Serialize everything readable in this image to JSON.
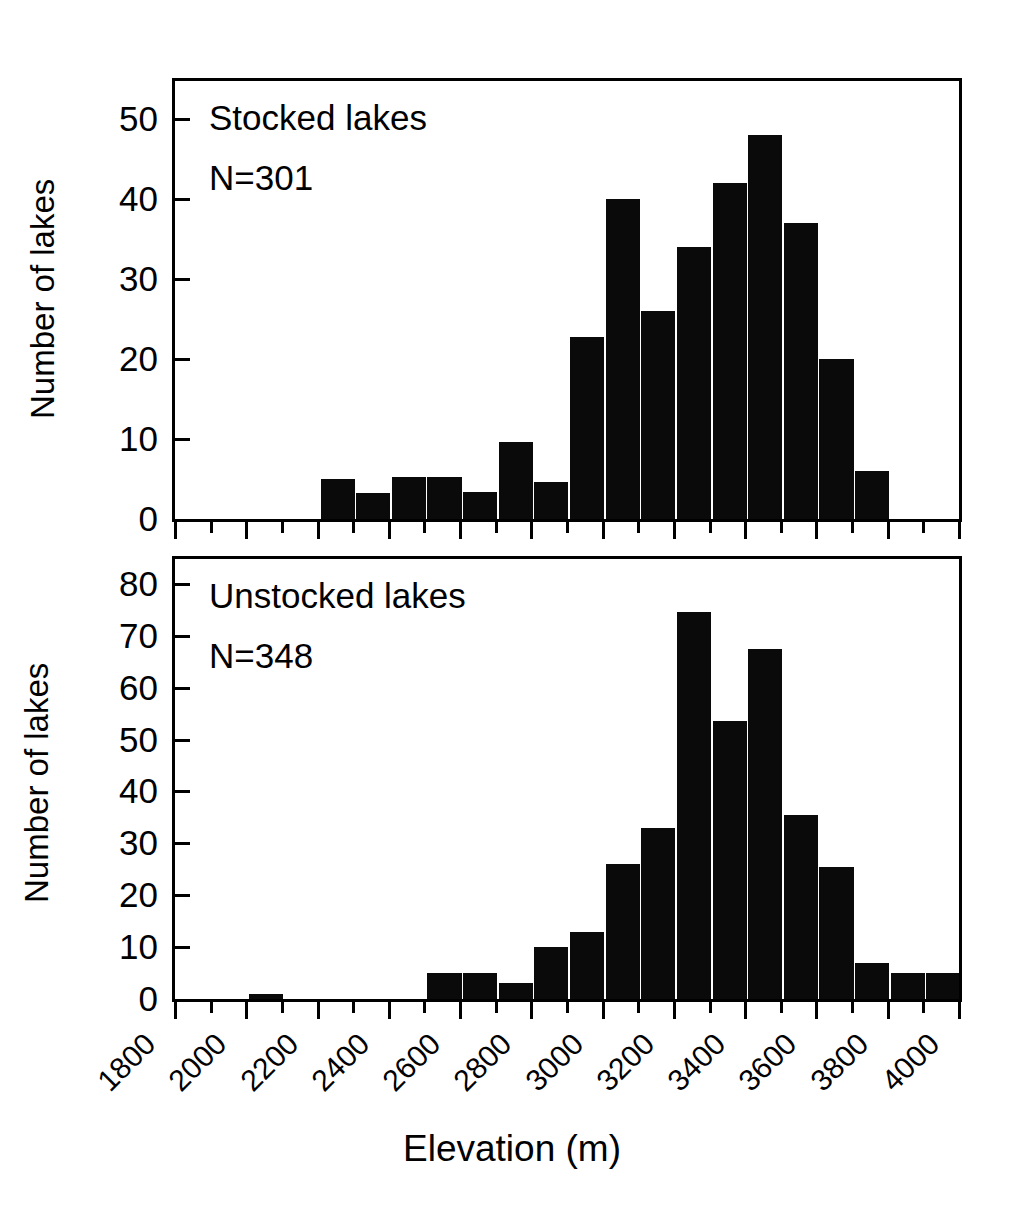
{
  "figure": {
    "xlabel": "Elevation (m)",
    "ylabel_top": "Number of lakes",
    "ylabel_bottom": "Number of lakes"
  },
  "panels": {
    "top": {
      "title": "Stocked lakes",
      "n_label": "N=301",
      "yticks": [
        "50",
        "40",
        "30",
        "20",
        "10",
        "0"
      ]
    },
    "bottom": {
      "title": "Unstocked lakes",
      "n_label": "N=348",
      "yticks": [
        "80",
        "70",
        "60",
        "50",
        "40",
        "30",
        "20",
        "10",
        "0"
      ]
    }
  },
  "xticks": [
    "1800",
    "2000",
    "2200",
    "2400",
    "2600",
    "2800",
    "3000",
    "3200",
    "3400",
    "3600",
    "3800",
    "4000"
  ],
  "chart_data": [
    {
      "type": "bar",
      "title": "Stocked lakes",
      "annotation": "N=301",
      "xlabel": "Elevation (m)",
      "ylabel": "Number of lakes",
      "xlim": [
        1800,
        4000
      ],
      "ylim": [
        0,
        55
      ],
      "bin_width": 100,
      "ytick_values": [
        0,
        10,
        20,
        30,
        40,
        50
      ],
      "xtick_values": [
        1800,
        2000,
        2200,
        2400,
        2600,
        2800,
        3000,
        3200,
        3400,
        3600,
        3800,
        4000
      ],
      "grid": false,
      "legend": "none",
      "bar_color": "#0a0a0a",
      "categories": [
        2200,
        2300,
        2400,
        2500,
        2600,
        2700,
        2800,
        2900,
        3000,
        3100,
        3200,
        3300,
        3400,
        3500,
        3600
      ],
      "values": [
        5,
        3.3,
        5.3,
        5.3,
        3.4,
        9.6,
        4.6,
        22.8,
        40,
        26,
        34,
        42,
        48,
        37,
        20
      ],
      "extra_bins": [
        3700
      ],
      "extra_values": [
        6
      ]
    },
    {
      "type": "bar",
      "title": "Unstocked lakes",
      "annotation": "N=348",
      "xlabel": "Elevation (m)",
      "ylabel": "Number of lakes",
      "xlim": [
        1800,
        4000
      ],
      "ylim": [
        0,
        86
      ],
      "bin_width": 100,
      "ytick_values": [
        0,
        10,
        20,
        30,
        40,
        50,
        60,
        70,
        80
      ],
      "xtick_values": [
        1800,
        2000,
        2200,
        2400,
        2600,
        2800,
        3000,
        3200,
        3400,
        3600,
        3800,
        4000
      ],
      "grid": false,
      "legend": "none",
      "bar_color": "#0a0a0a",
      "categories": [
        2000,
        2500,
        2600,
        2700,
        2800,
        2900,
        3000,
        3100,
        3200,
        3300,
        3400,
        3500,
        3600,
        3700,
        3800
      ],
      "values": [
        1,
        5,
        5,
        3,
        10,
        13,
        26,
        33,
        74.5,
        53.5,
        67.5,
        35.5,
        25.5,
        7,
        5
      ],
      "extra_bins": [
        3900
      ],
      "extra_values": [
        5
      ]
    }
  ],
  "bars_top": [
    {
      "x0": 2200,
      "v": 5
    },
    {
      "x0": 2300,
      "v": 3.3
    },
    {
      "x0": 2400,
      "v": 5.3
    },
    {
      "x0": 2500,
      "v": 5.3
    },
    {
      "x0": 2600,
      "v": 3.4
    },
    {
      "x0": 2700,
      "v": 9.6
    },
    {
      "x0": 2800,
      "v": 4.6
    },
    {
      "x0": 2900,
      "v": 22.8
    },
    {
      "x0": 3000,
      "v": 40
    },
    {
      "x0": 3100,
      "v": 26
    },
    {
      "x0": 3200,
      "v": 34
    },
    {
      "x0": 3300,
      "v": 42
    },
    {
      "x0": 3400,
      "v": 48
    },
    {
      "x0": 3500,
      "v": 37
    },
    {
      "x0": 3600,
      "v": 20
    },
    {
      "x0": 3700,
      "v": 6
    }
  ],
  "bars_bottom": [
    {
      "x0": 2000,
      "v": 1
    },
    {
      "x0": 2500,
      "v": 5
    },
    {
      "x0": 2600,
      "v": 5
    },
    {
      "x0": 2700,
      "v": 3
    },
    {
      "x0": 2800,
      "v": 10
    },
    {
      "x0": 2900,
      "v": 13
    },
    {
      "x0": 3000,
      "v": 26
    },
    {
      "x0": 3100,
      "v": 33
    },
    {
      "x0": 3200,
      "v": 74.5
    },
    {
      "x0": 3300,
      "v": 53.5
    },
    {
      "x0": 3400,
      "v": 67.5
    },
    {
      "x0": 3500,
      "v": 35.5
    },
    {
      "x0": 3600,
      "v": 25.5
    },
    {
      "x0": 3700,
      "v": 7
    },
    {
      "x0": 3800,
      "v": 5
    },
    {
      "x0": 3900,
      "v": 5
    }
  ]
}
